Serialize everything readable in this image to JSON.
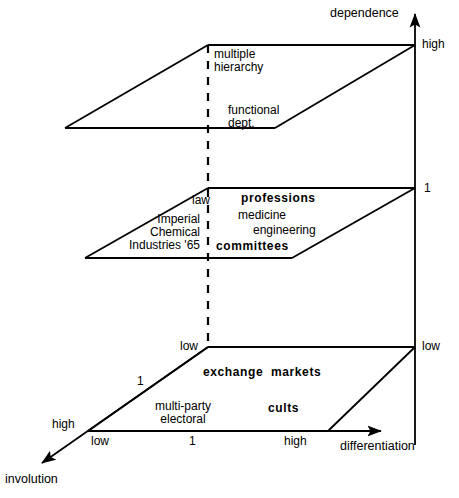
{
  "figure": {
    "title": "",
    "type": "three-plane 3D conceptual cube diagram"
  },
  "axes": {
    "vertical": {
      "name": "dependence",
      "ticks": [
        {
          "label": "high",
          "level": "top"
        },
        {
          "label": "1",
          "level": "middle"
        },
        {
          "label": "low",
          "level": "bottom"
        }
      ]
    },
    "horizontal": {
      "name": "differentiation",
      "ticks": [
        {
          "label": "low"
        },
        {
          "label": "1"
        },
        {
          "label": "high"
        }
      ]
    },
    "depth": {
      "name": "involution",
      "ticks": [
        {
          "label": "high"
        },
        {
          "label": "1"
        },
        {
          "label": "low"
        }
      ]
    }
  },
  "planes": {
    "top": {
      "name": "high-dependence-plane",
      "labels": [
        {
          "text": "multiple",
          "bold": false
        },
        {
          "text": "hierarchy",
          "bold": false
        },
        {
          "text": "functional",
          "bold": false
        },
        {
          "text": "dept.",
          "bold": false
        }
      ]
    },
    "middle": {
      "name": "unit-dependence-plane",
      "labels": [
        {
          "text": "law",
          "bold": false
        },
        {
          "text": "professions",
          "bold": true
        },
        {
          "text": "medicine",
          "bold": false
        },
        {
          "text": "engineering",
          "bold": false
        },
        {
          "text": "Imperial",
          "bold": false
        },
        {
          "text": "Chemical",
          "bold": false
        },
        {
          "text": "Industries '65",
          "bold": false
        },
        {
          "text": "committees",
          "bold": true
        }
      ]
    },
    "bottom": {
      "name": "low-dependence-plane",
      "labels": [
        {
          "text": "exchange  markets",
          "bold": true
        },
        {
          "text": "multi-party",
          "bold": false
        },
        {
          "text": "electoral",
          "bold": false
        },
        {
          "text": "cults",
          "bold": true
        }
      ]
    }
  },
  "colors": {
    "ink": "#000000",
    "background": "#ffffff"
  }
}
